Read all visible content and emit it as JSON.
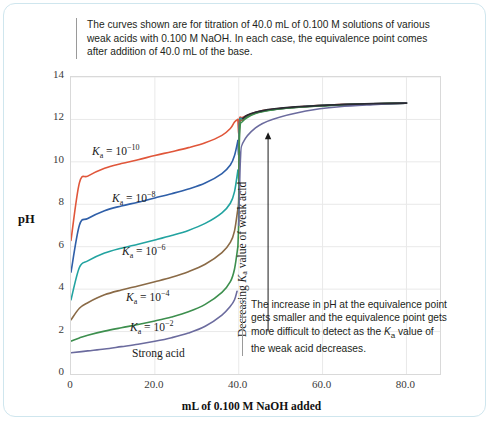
{
  "figure": {
    "caption_top": "The curves shown are for titration of 40.0 mL of 0.100 M solutions of various weak acids with 0.100 M NaOH. In each case, the equivalence point comes after addition of 40.0 mL of the base.",
    "caption_bottom_1": "The increase in pH at the equivalence point gets smaller and the equivalence point gets more difficult to detect as the ",
    "caption_bottom_ka": "K",
    "caption_bottom_ka_sub": "a",
    "caption_bottom_2": " value of the weak acid decreases.",
    "vertical_note_1": "Decreasing ",
    "vertical_note_ka": "K",
    "vertical_note_ka_sub": "a",
    "vertical_note_2": " value of weak acid",
    "border_color": "#cfe6ee"
  },
  "chart_data": {
    "type": "line",
    "title": "",
    "xlabel": "mL of 0.100 M NaOH added",
    "ylabel": "pH",
    "xlim": [
      0,
      88
    ],
    "ylim": [
      0,
      14
    ],
    "xticks": [
      0,
      20,
      40,
      60,
      80
    ],
    "xticklabels": [
      "0",
      "20.0",
      "40.0",
      "60.0",
      "80.0"
    ],
    "yticks": [
      0,
      2,
      4,
      6,
      8,
      10,
      12,
      14
    ],
    "yticklabels": [
      "0",
      "2",
      "4",
      "6",
      "8",
      "10",
      "12",
      "14"
    ],
    "grid": true,
    "legend": "inline-labels",
    "equivalence_volume_mL": 40.0,
    "analyte_volume_mL": 40.0,
    "analyte_concentration_M": 0.1,
    "titrant": "NaOH",
    "titrant_concentration_M": 0.1,
    "series": [
      {
        "name": "Ka = 10^-10",
        "ka": 1e-10,
        "color": "#e0563a",
        "label_html": "K<sub>a</sub> = 10<sup>&minus;10</sup>",
        "label_x_px": 88,
        "label_y_px": 139,
        "initial_pH": 6.3,
        "half_equivalence_pH": 10.0,
        "equivalence_pH": 11.35,
        "points": [
          [
            0,
            6.3
          ],
          [
            2,
            9.01
          ],
          [
            4,
            9.33
          ],
          [
            8,
            9.7
          ],
          [
            12,
            9.92
          ],
          [
            16,
            10.1
          ],
          [
            20,
            10.3
          ],
          [
            24,
            10.48
          ],
          [
            28,
            10.67
          ],
          [
            32,
            10.9
          ],
          [
            36,
            11.25
          ],
          [
            38,
            11.57
          ],
          [
            39,
            11.88
          ],
          [
            39.8,
            12.0
          ],
          [
            40,
            11.35
          ],
          [
            40.2,
            12.05
          ],
          [
            41,
            12.1
          ],
          [
            44,
            12.34
          ],
          [
            48,
            12.48
          ],
          [
            56,
            12.62
          ],
          [
            64,
            12.7
          ],
          [
            72,
            12.74
          ],
          [
            80,
            12.77
          ]
        ]
      },
      {
        "name": "Ka = 10^-8",
        "ka": 1e-08,
        "color": "#2f5fa8",
        "label_html": "K<sub>a</sub> = 10<sup>&minus;8</sup>",
        "label_x_px": 108,
        "label_y_px": 186,
        "initial_pH": 4.8,
        "half_equivalence_pH": 8.0,
        "equivalence_pH": 10.35,
        "points": [
          [
            0,
            4.8
          ],
          [
            2,
            7.01
          ],
          [
            4,
            7.33
          ],
          [
            8,
            7.7
          ],
          [
            12,
            7.92
          ],
          [
            16,
            8.1
          ],
          [
            20,
            8.3
          ],
          [
            24,
            8.5
          ],
          [
            28,
            8.72
          ],
          [
            32,
            9.0
          ],
          [
            36,
            9.45
          ],
          [
            38,
            9.85
          ],
          [
            39,
            10.3
          ],
          [
            39.8,
            11.0
          ],
          [
            40,
            10.35
          ],
          [
            40.2,
            11.9
          ],
          [
            41,
            12.05
          ],
          [
            44,
            12.32
          ],
          [
            48,
            12.47
          ],
          [
            56,
            12.61
          ],
          [
            64,
            12.69
          ],
          [
            72,
            12.74
          ],
          [
            80,
            12.77
          ]
        ]
      },
      {
        "name": "Ka = 10^-6",
        "ka": 1e-06,
        "color": "#22a3a0",
        "label_html": "K<sub>a</sub> = 10<sup>&minus;6</sup>",
        "label_x_px": 118,
        "label_y_px": 239,
        "initial_pH": 3.5,
        "half_equivalence_pH": 6.0,
        "equivalence_pH": 9.35,
        "points": [
          [
            0,
            3.5
          ],
          [
            2,
            5.02
          ],
          [
            4,
            5.33
          ],
          [
            8,
            5.7
          ],
          [
            12,
            5.93
          ],
          [
            16,
            6.12
          ],
          [
            20,
            6.32
          ],
          [
            24,
            6.53
          ],
          [
            28,
            6.77
          ],
          [
            32,
            7.1
          ],
          [
            36,
            7.6
          ],
          [
            38,
            8.05
          ],
          [
            39,
            8.6
          ],
          [
            39.8,
            9.6
          ],
          [
            40,
            9.35
          ],
          [
            40.2,
            11.8
          ],
          [
            41,
            12.02
          ],
          [
            44,
            12.31
          ],
          [
            48,
            12.46
          ],
          [
            56,
            12.61
          ],
          [
            64,
            12.69
          ],
          [
            72,
            12.74
          ],
          [
            80,
            12.77
          ]
        ]
      },
      {
        "name": "Ka = 10^-4",
        "ka": 0.0001,
        "color": "#8a6a46",
        "label_html": "K<sub>a</sub> = 10<sup>&minus;4</sup>",
        "label_x_px": 122,
        "label_y_px": 285,
        "initial_pH": 2.55,
        "half_equivalence_pH": 4.0,
        "equivalence_pH": 8.35,
        "points": [
          [
            0,
            2.55
          ],
          [
            2,
            3.1
          ],
          [
            4,
            3.36
          ],
          [
            8,
            3.73
          ],
          [
            12,
            3.96
          ],
          [
            16,
            4.15
          ],
          [
            20,
            4.35
          ],
          [
            24,
            4.56
          ],
          [
            28,
            4.82
          ],
          [
            32,
            5.17
          ],
          [
            36,
            5.72
          ],
          [
            38,
            6.2
          ],
          [
            39,
            6.75
          ],
          [
            39.8,
            7.8
          ],
          [
            40,
            8.35
          ],
          [
            40.2,
            11.6
          ],
          [
            41,
            11.98
          ],
          [
            44,
            12.3
          ],
          [
            48,
            12.46
          ],
          [
            56,
            12.6
          ],
          [
            64,
            12.69
          ],
          [
            72,
            12.74
          ],
          [
            80,
            12.77
          ]
        ]
      },
      {
        "name": "Ka = 10^-2",
        "ka": 0.01,
        "color": "#3d8f4e",
        "label_html": "K<sub>a</sub> = 10<sup>&minus;2</sup>",
        "label_x_px": 126,
        "label_y_px": 315,
        "initial_pH": 1.55,
        "half_equivalence_pH": 2.0,
        "equivalence_pH": 7.35,
        "points": [
          [
            0,
            1.55
          ],
          [
            2,
            1.7
          ],
          [
            4,
            1.83
          ],
          [
            8,
            2.02
          ],
          [
            12,
            2.18
          ],
          [
            16,
            2.33
          ],
          [
            20,
            2.5
          ],
          [
            24,
            2.69
          ],
          [
            28,
            2.93
          ],
          [
            32,
            3.28
          ],
          [
            36,
            3.85
          ],
          [
            38,
            4.35
          ],
          [
            39,
            4.95
          ],
          [
            39.8,
            6.0
          ],
          [
            40,
            7.35
          ],
          [
            40.2,
            11.3
          ],
          [
            41,
            11.92
          ],
          [
            44,
            12.28
          ],
          [
            48,
            12.45
          ],
          [
            56,
            12.6
          ],
          [
            64,
            12.68
          ],
          [
            72,
            12.73
          ],
          [
            80,
            12.77
          ]
        ]
      },
      {
        "name": "Strong acid",
        "ka": null,
        "color": "#6b6b9e",
        "label_html": "Strong acid",
        "label_x_px": 128,
        "label_y_px": 343,
        "initial_pH": 1.0,
        "equivalence_pH": 7.0,
        "points": [
          [
            0,
            1.0
          ],
          [
            4,
            1.09
          ],
          [
            8,
            1.18
          ],
          [
            12,
            1.29
          ],
          [
            16,
            1.4
          ],
          [
            20,
            1.54
          ],
          [
            24,
            1.71
          ],
          [
            28,
            1.93
          ],
          [
            32,
            2.25
          ],
          [
            36,
            2.78
          ],
          [
            38,
            3.19
          ],
          [
            39,
            3.5
          ],
          [
            39.6,
            3.9
          ],
          [
            40,
            7.0
          ],
          [
            40.4,
            10.1
          ],
          [
            41,
            10.9
          ],
          [
            44,
            11.6
          ],
          [
            48,
            12.0
          ],
          [
            56,
            12.4
          ],
          [
            64,
            12.6
          ],
          [
            72,
            12.7
          ],
          [
            80,
            12.77
          ]
        ]
      }
    ],
    "merged_branch": {
      "name": "merged-post-equivalence",
      "color": "#2b2b33",
      "points": [
        [
          41,
          12.05
        ],
        [
          42,
          12.2
        ],
        [
          44,
          12.34
        ],
        [
          46,
          12.43
        ],
        [
          48,
          12.49
        ],
        [
          52,
          12.57
        ],
        [
          56,
          12.62
        ],
        [
          60,
          12.66
        ],
        [
          64,
          12.7
        ],
        [
          70,
          12.73
        ],
        [
          76,
          12.76
        ],
        [
          80,
          12.77
        ]
      ]
    },
    "annotation_arrow": {
      "name": "decreasing-ka-arrow",
      "x_mL": 47.0,
      "y_from_pH": 2.0,
      "y_to_pH": 11.4,
      "direction": "up"
    }
  }
}
